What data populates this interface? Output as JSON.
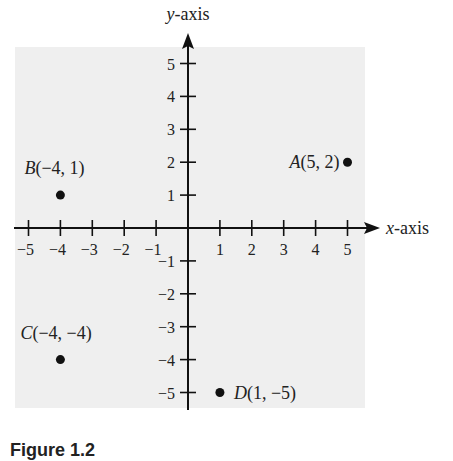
{
  "chart_data": {
    "type": "scatter",
    "title": "",
    "xlabel": "x-axis",
    "ylabel": "y-axis",
    "xlim": [
      -5,
      5
    ],
    "ylim": [
      -5,
      5
    ],
    "x_ticks": [
      -5,
      -4,
      -3,
      -2,
      -1,
      1,
      2,
      3,
      4,
      5
    ],
    "y_ticks": [
      5,
      4,
      3,
      2,
      1,
      -1,
      -2,
      -3,
      -4,
      -5
    ],
    "grid": false,
    "background": "#efefef",
    "points": [
      {
        "name": "A",
        "x": 5,
        "y": 2,
        "label": "A(5, 2)"
      },
      {
        "name": "B",
        "x": -4,
        "y": 1,
        "label": "B(−4, 1)"
      },
      {
        "name": "C",
        "x": -4,
        "y": -4,
        "label": "C(−4, −4)"
      },
      {
        "name": "D",
        "x": 1,
        "y": -5,
        "label": "D(1, −5)"
      }
    ]
  },
  "caption": "Figure 1.2"
}
